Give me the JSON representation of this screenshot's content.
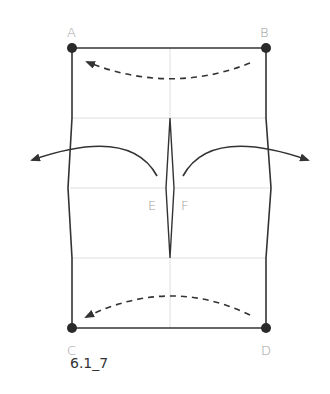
{
  "diagram": {
    "type": "folding-instruction",
    "caption": "6.1_7",
    "points": {
      "A": {
        "label": "A",
        "x": 72,
        "y": 48
      },
      "B": {
        "label": "B",
        "x": 266,
        "y": 48
      },
      "C": {
        "label": "C",
        "x": 72,
        "y": 328
      },
      "D": {
        "label": "D",
        "x": 266,
        "y": 328
      },
      "E": {
        "label": "E"
      },
      "F": {
        "label": "F"
      }
    },
    "arrows": [
      {
        "name": "fold-B-to-A",
        "style": "dashed",
        "from": "B",
        "to": "A"
      },
      {
        "name": "unfold-left",
        "style": "solid",
        "direction": "left"
      },
      {
        "name": "unfold-right",
        "style": "solid",
        "direction": "right"
      },
      {
        "name": "fold-D-to-C",
        "style": "dashed",
        "from": "D",
        "to": "C"
      }
    ],
    "colors": {
      "outline": "#333333",
      "crease": "#dddddd",
      "label": "#9a9a9a"
    }
  }
}
